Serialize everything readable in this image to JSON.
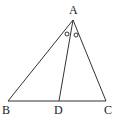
{
  "diagram": {
    "type": "triangle-angle-bisector",
    "points": {
      "A": {
        "label": "A",
        "x": 73,
        "y": 20
      },
      "B": {
        "label": "B",
        "x": 8,
        "y": 101
      },
      "C": {
        "label": "C",
        "x": 106,
        "y": 101
      },
      "D": {
        "label": "D",
        "x": 59,
        "y": 101
      }
    },
    "segments": [
      "AB",
      "AC",
      "BC",
      "AD"
    ],
    "angle_marks": [
      {
        "between": [
          "BAD"
        ],
        "symbol": "○"
      },
      {
        "between": [
          "DAC"
        ],
        "symbol": "○"
      }
    ],
    "colors": {
      "stroke": "#333333",
      "text": "#222222"
    }
  }
}
